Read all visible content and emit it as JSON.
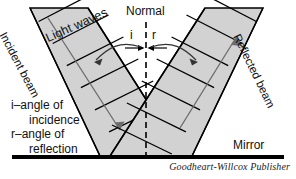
{
  "figure": {
    "title_concept": "Reflection of light waves from a mirror",
    "background_color": "#ffffff"
  },
  "labels": {
    "normal": "Normal",
    "angle_i": "i",
    "angle_r": "r",
    "mirror": "Mirror",
    "incident_beam": "Incident beam",
    "light_waves": "Light waves",
    "reflected_beam": "Reflected beam"
  },
  "legend": {
    "line1": "i–angle of",
    "line2": "incidence",
    "line3": "r–angle of",
    "line4": "reflection"
  },
  "credit": "Goodheart-Willcox Publisher",
  "colors": {
    "beam_fill": "#d2d2d2",
    "beam_outline": "#000000",
    "wavefront_line": "#000000",
    "normal_dashed": "#000000",
    "mirror_line": "#000000",
    "arrow_gray": "#6b6b6b",
    "text": "#111111"
  },
  "geometry": {
    "normal_x": 146,
    "mirror_y": 156,
    "mirror_x_start": 12,
    "mirror_x_end": 284,
    "incidence_point_x": 146,
    "beam_angle_degrees": 45
  }
}
